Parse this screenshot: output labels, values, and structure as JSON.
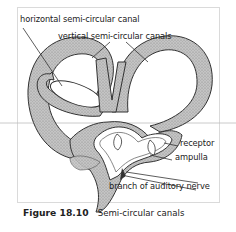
{
  "figure": {
    "number": "Figure 18.10",
    "title": "Semi-circular canals"
  },
  "labels": {
    "horizontal_canal": "horizontal semi-circular canal",
    "vertical_canals": "vertical semi-circular canals",
    "receptor": "receptor",
    "ampulla": "ampulla",
    "nerve": "branch of auditory nerve"
  },
  "colors": {
    "canal_fill": "#b9b9b9",
    "outline": "#333333",
    "frame_border": "#d8d8d8",
    "background": "#ffffff"
  }
}
